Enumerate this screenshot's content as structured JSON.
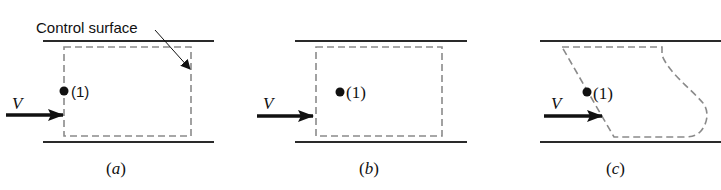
{
  "callout": {
    "label": "Control surface"
  },
  "colors": {
    "wall": "#2a2a2a",
    "control_surface": "#8a8a8a",
    "arrow": "#111111"
  },
  "panels": [
    {
      "id": "a",
      "caption": "(a)",
      "velocity_label": "V",
      "point_label": "(1)"
    },
    {
      "id": "b",
      "caption": "(b)",
      "velocity_label": "V",
      "point_label": "(1)"
    },
    {
      "id": "c",
      "caption": "(c)",
      "velocity_label": "V",
      "point_label": "(1)"
    }
  ]
}
